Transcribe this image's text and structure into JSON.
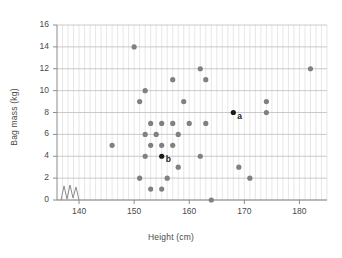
{
  "chart_data": {
    "type": "scatter",
    "title": "",
    "xlabel": "Height (cm)",
    "ylabel": "Bag mass (kg)",
    "xlim": [
      136,
      185
    ],
    "ylim": [
      0,
      16
    ],
    "xticks": [
      140,
      150,
      160,
      170,
      180
    ],
    "yticks": [
      0,
      2,
      4,
      6,
      8,
      10,
      12,
      14,
      16
    ],
    "x_minor_step": 1,
    "y_major_step": 2,
    "grid": "minor vertical gridlines every 1 cm, major horizontal gridlines every 2 kg",
    "axis_break": true,
    "axis_break_note": "zigzag break symbol on x-axis between origin and 140",
    "legend": "none",
    "point_color": "#808080",
    "highlight_color": "#1a1a1a",
    "series": [
      {
        "name": "students",
        "color": "#808080",
        "points": [
          {
            "x": 146,
            "y": 5
          },
          {
            "x": 150,
            "y": 14
          },
          {
            "x": 151,
            "y": 9
          },
          {
            "x": 151,
            "y": 2
          },
          {
            "x": 152,
            "y": 10
          },
          {
            "x": 152,
            "y": 6
          },
          {
            "x": 152,
            "y": 4
          },
          {
            "x": 153,
            "y": 7
          },
          {
            "x": 153,
            "y": 5
          },
          {
            "x": 153,
            "y": 1
          },
          {
            "x": 154,
            "y": 6
          },
          {
            "x": 155,
            "y": 7
          },
          {
            "x": 155,
            "y": 5
          },
          {
            "x": 155,
            "y": 1
          },
          {
            "x": 156,
            "y": 2
          },
          {
            "x": 157,
            "y": 11
          },
          {
            "x": 157,
            "y": 7
          },
          {
            "x": 157,
            "y": 5
          },
          {
            "x": 158,
            "y": 6
          },
          {
            "x": 158,
            "y": 3
          },
          {
            "x": 159,
            "y": 9
          },
          {
            "x": 160,
            "y": 7
          },
          {
            "x": 162,
            "y": 12
          },
          {
            "x": 162,
            "y": 4
          },
          {
            "x": 163,
            "y": 11
          },
          {
            "x": 163,
            "y": 7
          },
          {
            "x": 164,
            "y": 0
          },
          {
            "x": 169,
            "y": 3
          },
          {
            "x": 171,
            "y": 2
          },
          {
            "x": 174,
            "y": 9
          },
          {
            "x": 174,
            "y": 8
          },
          {
            "x": 182,
            "y": 12
          }
        ]
      },
      {
        "name": "labelled",
        "color": "#1a1a1a",
        "points": [
          {
            "x": 168,
            "y": 8,
            "label": "a"
          },
          {
            "x": 155,
            "y": 4,
            "label": "b"
          }
        ]
      }
    ]
  }
}
